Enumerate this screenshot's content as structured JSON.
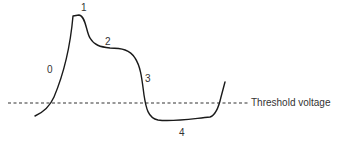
{
  "diagram": {
    "type": "action-potential-phases",
    "curve_color": "#1a1a1a",
    "threshold": {
      "label": "Threshold voltage",
      "line_style": "dashed",
      "color": "#333333"
    },
    "phases": [
      {
        "id": "0",
        "label": "0"
      },
      {
        "id": "1",
        "label": "1"
      },
      {
        "id": "2",
        "label": "2"
      },
      {
        "id": "3",
        "label": "3"
      },
      {
        "id": "4",
        "label": "4"
      }
    ]
  }
}
